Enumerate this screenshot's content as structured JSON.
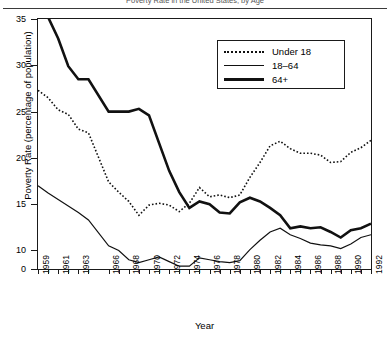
{
  "figure": {
    "cropped_title": "Poverty Rate in the United States, by Age",
    "xtitle": "Year",
    "ytitle": "Poverty Rate (percentage of population)"
  },
  "legend": {
    "items": [
      {
        "label": "Under 18",
        "style": "dotted"
      },
      {
        "label": "18–64",
        "style": "thin"
      },
      {
        "label": "64+",
        "style": "thick"
      }
    ]
  },
  "chart_data": {
    "type": "line",
    "title": "Poverty Rate in the United States, by Age",
    "xlabel": "Year",
    "ylabel": "Poverty Rate (percentage of population)",
    "xlim": [
      1959,
      1992
    ],
    "ylim": [
      8,
      35
    ],
    "yticks": [
      0,
      10,
      15,
      20,
      25,
      30,
      35
    ],
    "y_axis_broken": true,
    "grid": false,
    "legend_position": "upper right",
    "xticks": [
      1959,
      1960,
      1961,
      1962,
      1963,
      1964,
      1966,
      1967,
      1968,
      1969,
      1970,
      1971,
      1972,
      1973,
      1974,
      1975,
      1976,
      1977,
      1978,
      1979,
      1980,
      1981,
      1982,
      1983,
      1984,
      1985,
      1986,
      1987,
      1988,
      1989,
      1990,
      1991,
      1992
    ],
    "xtick_labels": [
      "1959",
      "",
      "1961",
      "",
      "1963",
      "",
      "1966",
      "",
      "1968",
      "",
      "1970",
      "",
      "1972",
      "",
      "1974",
      "",
      "1976",
      "",
      "1978",
      "",
      "1980",
      "",
      "1982",
      "",
      "1984",
      "",
      "1986",
      "",
      "1988",
      "",
      "1990",
      "",
      "1992"
    ],
    "x": [
      1959,
      1960,
      1961,
      1962,
      1963,
      1964,
      1966,
      1967,
      1968,
      1969,
      1970,
      1971,
      1972,
      1973,
      1974,
      1975,
      1976,
      1977,
      1978,
      1979,
      1980,
      1981,
      1982,
      1983,
      1984,
      1985,
      1986,
      1987,
      1988,
      1989,
      1990,
      1991,
      1992
    ],
    "series": [
      {
        "name": "Under 18",
        "style": "dotted",
        "values": [
          27.3,
          26.5,
          25.2,
          24.7,
          23.1,
          22.7,
          17.4,
          16.3,
          15.3,
          13.8,
          14.9,
          15.1,
          14.9,
          14.2,
          15.1,
          16.8,
          15.8,
          16.0,
          15.7,
          16.0,
          17.9,
          19.5,
          21.3,
          21.8,
          21.0,
          20.5,
          20.5,
          20.3,
          19.5,
          19.6,
          20.6,
          21.1,
          21.9
        ]
      },
      {
        "name": "18–64",
        "style": "thin",
        "values": [
          17.0,
          16.2,
          15.5,
          14.8,
          14.1,
          13.3,
          10.5,
          10.0,
          9.0,
          8.7,
          9.0,
          9.3,
          8.8,
          8.3,
          8.3,
          9.2,
          9.0,
          8.8,
          8.7,
          8.9,
          10.1,
          11.1,
          12.0,
          12.4,
          11.7,
          11.3,
          10.8,
          10.6,
          10.5,
          10.2,
          10.7,
          11.4,
          11.7
        ]
      },
      {
        "name": "64+",
        "style": "thick",
        "values": [
          35.2,
          35.2,
          32.9,
          29.9,
          28.5,
          28.5,
          25.0,
          25.0,
          25.0,
          25.3,
          24.6,
          21.6,
          18.6,
          16.3,
          14.6,
          15.3,
          15.0,
          14.1,
          14.0,
          15.2,
          15.7,
          15.3,
          14.6,
          13.8,
          12.4,
          12.6,
          12.4,
          12.5,
          12.0,
          11.4,
          12.2,
          12.4,
          12.9
        ]
      }
    ]
  }
}
